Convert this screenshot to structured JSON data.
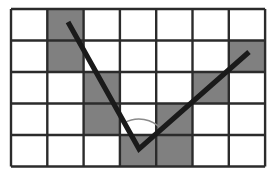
{
  "figure": {
    "name": "angle-on-grid-diagram",
    "background_color": "#ffffff"
  },
  "grid": {
    "columns": 7,
    "rows": 5,
    "origin_x": 11,
    "origin_y": 9,
    "cell_width": 36.3,
    "cell_height": 31.5,
    "line_color": "#2b2b2b",
    "line_width": 2.4,
    "cell_fill_empty": "#ffffff",
    "cell_fill_shaded": "#808080",
    "shaded_cells": [
      {
        "row": 0,
        "col": 1
      },
      {
        "row": 1,
        "col": 1
      },
      {
        "row": 1,
        "col": 6
      },
      {
        "row": 2,
        "col": 2
      },
      {
        "row": 2,
        "col": 5
      },
      {
        "row": 3,
        "col": 2
      },
      {
        "row": 3,
        "col": 4
      },
      {
        "row": 4,
        "col": 3
      },
      {
        "row": 4,
        "col": 4
      }
    ]
  },
  "angle": {
    "vertex": {
      "x": 139,
      "y": 149
    },
    "ray_left_end": {
      "x": 68,
      "y": 22
    },
    "ray_right_end": {
      "x": 249,
      "y": 52
    },
    "stroke_color": "#1a1a1a",
    "stroke_width": 5.2,
    "arc": {
      "radius": 30,
      "stroke_color": "#8a8a8a",
      "stroke_width": 1.6
    }
  }
}
